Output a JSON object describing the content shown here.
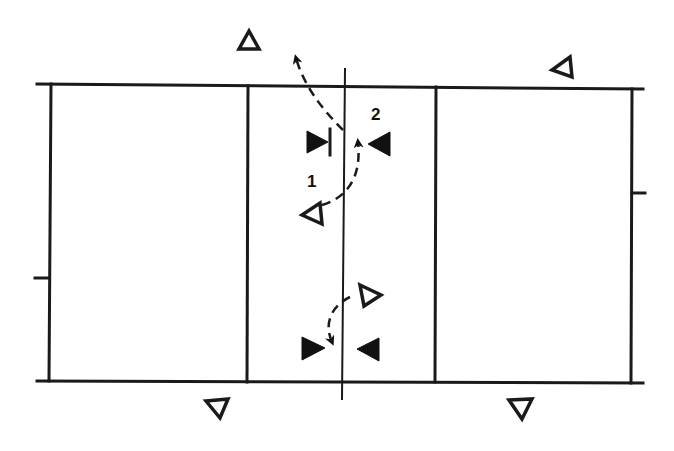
{
  "diagram": {
    "type": "volleyball-court-play-diagram",
    "colors": {
      "ink": "#1a1a1a",
      "background": "#ffffff"
    },
    "court": {
      "outer": {
        "left": 37,
        "top": 84,
        "right": 633,
        "bottom": 381
      },
      "net_x": 343,
      "attack_lines_x": [
        247,
        436
      ],
      "net_post_extension": {
        "top": 68,
        "bottom": 400
      },
      "side_ticks": [
        {
          "side": "left",
          "y": 278
        },
        {
          "side": "right",
          "y": 193
        }
      ]
    },
    "labels": [
      {
        "id": "label-1",
        "text": "1",
        "x": 313,
        "y": 186
      },
      {
        "id": "label-2",
        "text": "2",
        "x": 376,
        "y": 118
      }
    ],
    "players": [
      {
        "id": "open-top-left",
        "kind": "open",
        "x": 249,
        "y": 40,
        "dir": "up"
      },
      {
        "id": "open-top-right",
        "kind": "open",
        "x": 564,
        "y": 67,
        "dir": "up-left"
      },
      {
        "id": "open-mid-left",
        "kind": "open",
        "x": 313,
        "y": 213,
        "dir": "left"
      },
      {
        "id": "open-lower-right",
        "kind": "open",
        "x": 368,
        "y": 295,
        "dir": "right"
      },
      {
        "id": "open-bottom-left",
        "kind": "open",
        "x": 220,
        "y": 408,
        "dir": "down"
      },
      {
        "id": "open-bottom-right",
        "kind": "open",
        "x": 520,
        "y": 407,
        "dir": "down"
      },
      {
        "id": "blocker-top-left",
        "kind": "solid",
        "x": 318,
        "y": 142,
        "dir": "right",
        "bar": true
      },
      {
        "id": "blocker-top-right",
        "kind": "solid",
        "x": 380,
        "y": 144,
        "dir": "left"
      },
      {
        "id": "blocker-bottom-left",
        "kind": "solid",
        "x": 314,
        "y": 348,
        "dir": "right"
      },
      {
        "id": "blocker-bottom-right",
        "kind": "solid",
        "x": 370,
        "y": 349,
        "dir": "left"
      }
    ],
    "paths": [
      {
        "id": "path-1",
        "label": "1",
        "d": "M 322 205 C 345 198, 362 180, 358 140"
      },
      {
        "id": "path-2",
        "label": "2",
        "d": "M 345 130 C 330 115, 310 95, 297 58"
      },
      {
        "id": "path-3",
        "d": "M 350 297 C 333 305, 325 320, 330 340"
      }
    ]
  }
}
